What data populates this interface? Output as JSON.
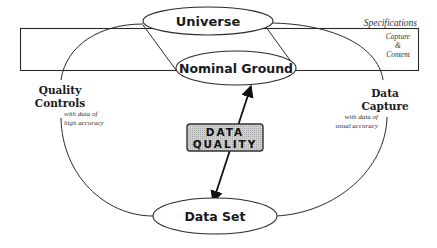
{
  "diagram": {
    "nodes": {
      "universe": "Universe",
      "nominal_ground": "Nominal Ground",
      "data_set": "Data Set"
    },
    "center_box": {
      "line1": "DATA",
      "line2": "QUALITY",
      "fill_color": "#c8c8c8",
      "border_color": "#333333"
    },
    "specifications": {
      "title": "Specifications",
      "line1": "Capture",
      "line2": "&",
      "line3": "Content"
    },
    "left_label": {
      "line1": "Quality",
      "line2": "Controls",
      "note1": "with data of",
      "note2": "high accuracy"
    },
    "right_label": {
      "line1": "Data",
      "line2": "Capture",
      "note1": "with data of",
      "note2": "usual accuracy"
    },
    "colors": {
      "stroke": "#2a2a2a",
      "background": "#ffffff"
    }
  }
}
